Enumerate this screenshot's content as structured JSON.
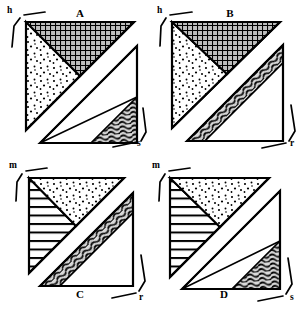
{
  "figure": {
    "title": "",
    "background_color": "#ffffff",
    "ink_color": "#000000",
    "fill_gray": "#d9d9d9",
    "panel_count": 4
  },
  "panels": [
    {
      "id": "A",
      "label": "A",
      "label_position": "top",
      "corner_labels": [
        {
          "text": "h",
          "position": "top-left"
        },
        {
          "text": "s",
          "position": "bottom-right"
        }
      ],
      "regions": [
        {
          "name": "upper-left-stipple",
          "texture": "stipple-dots"
        },
        {
          "name": "upper-right-crosshatch",
          "texture": "cross-hatch-grid"
        },
        {
          "name": "lower-left-blank",
          "texture": "blank"
        },
        {
          "name": "lower-right-wavy",
          "texture": "wavy-squiggle"
        }
      ]
    },
    {
      "id": "B",
      "label": "B",
      "label_position": "top",
      "corner_labels": [
        {
          "text": "h",
          "position": "top-left"
        },
        {
          "text": "r",
          "position": "bottom-right"
        }
      ],
      "regions": [
        {
          "name": "upper-left-stipple",
          "texture": "stipple-dots"
        },
        {
          "name": "upper-right-crosshatch",
          "texture": "cross-hatch-grid"
        },
        {
          "name": "lower-left-blank",
          "texture": "blank"
        },
        {
          "name": "diagonal-band-wavy",
          "texture": "wavy-squiggle-band"
        }
      ]
    },
    {
      "id": "C",
      "label": "C",
      "label_position": "bottom",
      "corner_labels": [
        {
          "text": "m",
          "position": "top-left"
        },
        {
          "text": "r",
          "position": "bottom-right"
        }
      ],
      "regions": [
        {
          "name": "upper-left-horizontal-lines",
          "texture": "horizontal-lines"
        },
        {
          "name": "upper-right-stipple",
          "texture": "stipple-dots"
        },
        {
          "name": "lower-left-blank",
          "texture": "blank"
        },
        {
          "name": "diagonal-band-wavy",
          "texture": "wavy-squiggle-band"
        }
      ]
    },
    {
      "id": "D",
      "label": "D",
      "label_position": "bottom",
      "corner_labels": [
        {
          "text": "m",
          "position": "top-left"
        },
        {
          "text": "s",
          "position": "bottom-right"
        }
      ],
      "regions": [
        {
          "name": "upper-left-horizontal-lines",
          "texture": "horizontal-lines"
        },
        {
          "name": "upper-right-stipple",
          "texture": "stipple-dots"
        },
        {
          "name": "lower-left-blank",
          "texture": "blank"
        },
        {
          "name": "lower-right-wavy",
          "texture": "wavy-squiggle"
        }
      ]
    }
  ],
  "labels": {
    "A": "A",
    "B": "B",
    "C": "C",
    "D": "D",
    "h1": "h",
    "s1": "s",
    "h2": "h",
    "r2": "r",
    "m3": "m",
    "r3": "r",
    "m4": "m",
    "s4": "s"
  }
}
